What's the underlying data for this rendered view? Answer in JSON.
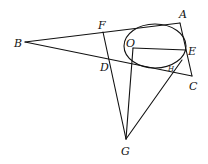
{
  "diagram": {
    "type": "geometry",
    "points": {
      "A": {
        "label": "A",
        "x": 180,
        "y": 23
      },
      "B": {
        "label": "B",
        "x": 25,
        "y": 42
      },
      "C": {
        "label": "C",
        "x": 192,
        "y": 76
      },
      "D": {
        "label": "D",
        "x": 110,
        "y": 57
      },
      "E": {
        "label": "E",
        "x": 186,
        "y": 50
      },
      "F": {
        "label": "F",
        "x": 103,
        "y": 32
      },
      "G": {
        "label": "G",
        "x": 126,
        "y": 139
      },
      "O": {
        "label": "O",
        "x": 133,
        "y": 48
      },
      "H": {
        "label": "H",
        "x": 172,
        "y": 66
      }
    },
    "ellipse": {
      "cx": 155,
      "cy": 46,
      "rx": 31,
      "ry": 22
    },
    "segments": [
      "BA",
      "BC",
      "AC",
      "FG",
      "OG",
      "OE",
      "GH"
    ]
  }
}
